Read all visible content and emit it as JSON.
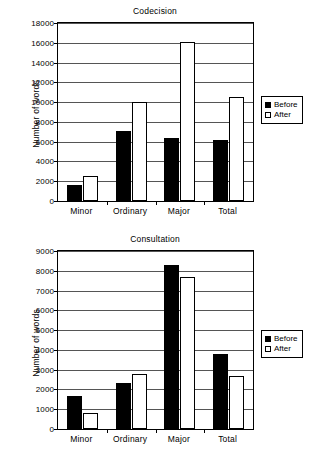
{
  "legend": {
    "before_label": "Before",
    "after_label": "After",
    "before_color": "#000000",
    "after_color": "#ffffff"
  },
  "axis": {
    "ylabel": "Number of words"
  },
  "chart_data": [
    {
      "id": "codecision",
      "type": "bar",
      "title": "Codecision",
      "xlabel": "",
      "ylabel": "Number of words",
      "ylim": [
        0,
        18000
      ],
      "ytick_step": 2000,
      "yticks": [
        0,
        2000,
        4000,
        6000,
        8000,
        10000,
        12000,
        14000,
        16000,
        18000
      ],
      "ytick_labels": [
        "0",
        "2000",
        "4000",
        "6000",
        "8000",
        "10000",
        "12000",
        "14000",
        "16000",
        "18000"
      ],
      "grid": true,
      "legend_position": "right",
      "categories": [
        "Minor",
        "Ordinary",
        "Major",
        "Total"
      ],
      "series": [
        {
          "name": "Before",
          "values": [
            1650,
            7100,
            6400,
            6150
          ]
        },
        {
          "name": "After",
          "values": [
            2500,
            10000,
            16100,
            10500
          ]
        }
      ]
    },
    {
      "id": "consultation",
      "type": "bar",
      "title": "Consultation",
      "xlabel": "",
      "ylabel": "Number of words",
      "ylim": [
        0,
        9000
      ],
      "ytick_step": 1000,
      "yticks": [
        0,
        1000,
        2000,
        3000,
        4000,
        5000,
        6000,
        7000,
        8000,
        9000
      ],
      "ytick_labels": [
        "0",
        "1000",
        "2000",
        "3000",
        "4000",
        "5000",
        "6000",
        "7000",
        "8000",
        "9000"
      ],
      "grid": true,
      "legend_position": "right",
      "categories": [
        "Minor",
        "Ordinary",
        "Major",
        "Total"
      ],
      "series": [
        {
          "name": "Before",
          "values": [
            1650,
            2350,
            8300,
            3800
          ]
        },
        {
          "name": "After",
          "values": [
            800,
            2800,
            7700,
            2680
          ]
        }
      ]
    }
  ]
}
